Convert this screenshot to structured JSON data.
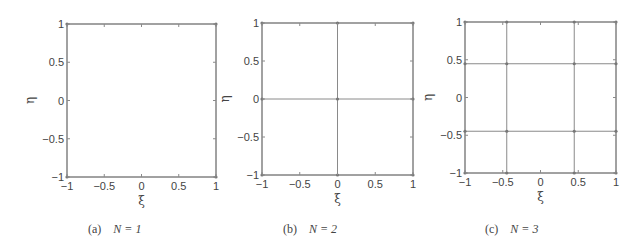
{
  "chart_data": [
    {
      "type": "scatter",
      "title": "",
      "caption": "(a)   N = 1",
      "caption_tag": "(a)",
      "caption_eq": "N = 1",
      "xlabel": "ξ",
      "ylabel": "η",
      "xlim": [
        -1,
        1
      ],
      "ylim": [
        -1,
        1
      ],
      "xticks": [
        "-1",
        "-0.5",
        "0",
        "0.5",
        "1"
      ],
      "yticks": [
        "-1",
        "-0.5",
        "0",
        "0.5",
        "1"
      ],
      "grid_nodes": [
        -1,
        1
      ],
      "grid": false,
      "legend": null
    },
    {
      "type": "scatter",
      "title": "",
      "caption": "(b)   N = 2",
      "caption_tag": "(b)",
      "caption_eq": "N = 2",
      "xlabel": "ξ",
      "ylabel": "η",
      "xlim": [
        -1,
        1
      ],
      "ylim": [
        -1,
        1
      ],
      "xticks": [
        "-1",
        "-0.5",
        "0",
        "0.5",
        "1"
      ],
      "yticks": [
        "-1",
        "-0.5",
        "0",
        "0.5",
        "1"
      ],
      "grid_nodes": [
        -1,
        0,
        1
      ],
      "grid": false,
      "legend": null
    },
    {
      "type": "scatter",
      "title": "",
      "caption": "(c)   N = 3",
      "caption_tag": "(c)",
      "caption_eq": "N = 3",
      "xlabel": "ξ",
      "ylabel": "η",
      "xlim": [
        -1,
        1
      ],
      "ylim": [
        -1,
        1
      ],
      "xticks": [
        "-1",
        "-0.5",
        "0",
        "0.5",
        "1"
      ],
      "yticks": [
        "-1",
        "-0.5",
        "0",
        "0.5",
        "1"
      ],
      "grid_nodes": [
        -1,
        -0.447,
        0.447,
        1
      ],
      "grid": false,
      "legend": null
    }
  ],
  "panels": [
    {
      "caption_tag": "(a)",
      "caption_eq": "N = 1"
    },
    {
      "caption_tag": "(b)",
      "caption_eq": "N = 2"
    },
    {
      "caption_tag": "(c)",
      "caption_eq": "N = 3"
    }
  ],
  "style": {
    "line_color": "#8a8a8a",
    "node_color": "#777777",
    "frame_color": "#8a8a8a"
  }
}
